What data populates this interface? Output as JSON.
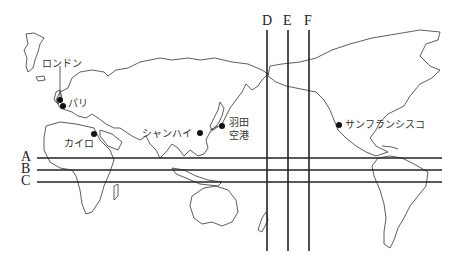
{
  "map": {
    "type": "world map (Pacific-centered, outline)",
    "horizontal_lines": [
      {
        "label": "A",
        "y": 158
      },
      {
        "label": "B",
        "y": 170
      },
      {
        "label": "C",
        "y": 182
      }
    ],
    "vertical_lines": [
      {
        "label": "D",
        "x": 267
      },
      {
        "label": "E",
        "x": 288
      },
      {
        "label": "F",
        "x": 309
      }
    ],
    "cities": [
      {
        "id": "london",
        "name": "ロンドン"
      },
      {
        "id": "paris",
        "name": "パリ"
      },
      {
        "id": "cairo",
        "name": "カイロ"
      },
      {
        "id": "shanghai",
        "name": "シャンハイ"
      },
      {
        "id": "haneda",
        "name_line1": "羽田",
        "name_line2": "空港"
      },
      {
        "id": "sanfrancisco",
        "name": "サンフランシスコ"
      }
    ],
    "colors": {
      "line": "#222222",
      "land_outline": "#333333",
      "background": "#ffffff"
    }
  }
}
